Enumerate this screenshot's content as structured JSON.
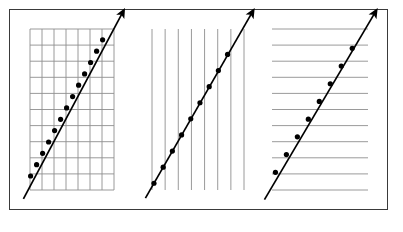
{
  "figure": {
    "background_color": "#ffffff",
    "frame": {
      "name": "outer-border",
      "x": 9,
      "y": 9,
      "width": 379,
      "height": 201,
      "stroke_color": "#3a3a3a",
      "stroke_width": 1.2
    },
    "grid_color": "#8f8f8f",
    "grid_stroke_width": 0.9,
    "data_color": "#000000",
    "data_stroke_width": 1.7,
    "marker_radius": 2.6,
    "panel_count": 3
  },
  "chart_data": [
    {
      "type": "scatter",
      "name": "panel-full-grid",
      "title": "",
      "xlabel": "",
      "ylabel": "",
      "grid": "both",
      "grid_columns": 7,
      "grid_rows": 10,
      "legend": "none",
      "xlim": [
        0,
        7
      ],
      "ylim": [
        0,
        10
      ],
      "plot_box": {
        "x": 30,
        "y": 29,
        "width": 84,
        "height": 161
      },
      "gridline_x_values": [
        0,
        1,
        2,
        3,
        4,
        5,
        6,
        7
      ],
      "gridline_y_values": [
        0,
        1,
        2,
        3,
        4,
        5,
        6,
        7,
        8,
        9,
        10
      ],
      "line": {
        "start": {
          "x": -0.55,
          "y": -0.55
        },
        "end": {
          "x": 7.7,
          "y": 11.0
        },
        "arrow_at_end": true
      },
      "x": [
        0.05,
        0.55,
        1.05,
        1.55,
        2.05,
        2.55,
        3.05,
        3.55,
        4.05,
        4.55,
        5.05,
        5.55,
        6.05
      ],
      "values": [
        0.87,
        1.57,
        2.28,
        2.98,
        3.69,
        4.39,
        5.1,
        5.8,
        6.51,
        7.21,
        7.92,
        8.62,
        9.33
      ],
      "point_count": 13
    },
    {
      "type": "scatter",
      "name": "panel-vertical-grid",
      "title": "",
      "xlabel": "",
      "ylabel": "",
      "grid": "vertical-only",
      "grid_columns": 8,
      "grid_rows": 0,
      "legend": "none",
      "xlim": [
        0,
        7
      ],
      "ylim": [
        0,
        10
      ],
      "plot_box": {
        "x": 152,
        "y": 29,
        "width": 92,
        "height": 161
      },
      "gridline_x_values": [
        0,
        1,
        2,
        3,
        4,
        5,
        6,
        7
      ],
      "gridline_y_values": [],
      "line": {
        "start": {
          "x": -0.5,
          "y": -0.5
        },
        "end": {
          "x": 7.6,
          "y": 11.0
        },
        "arrow_at_end": true
      },
      "x": [
        0.15,
        0.85,
        1.55,
        2.25,
        2.95,
        3.65,
        4.35,
        5.05,
        5.75
      ],
      "values": [
        0.42,
        1.42,
        2.42,
        3.42,
        4.42,
        5.42,
        6.42,
        7.42,
        8.42
      ],
      "point_count": 9
    },
    {
      "type": "scatter",
      "name": "panel-horizontal-grid",
      "title": "",
      "xlabel": "",
      "ylabel": "",
      "grid": "horizontal-only",
      "grid_columns": 0,
      "grid_rows": 10,
      "legend": "none",
      "xlim": [
        0,
        7
      ],
      "ylim": [
        0,
        10
      ],
      "plot_box": {
        "x": 272,
        "y": 29,
        "width": 96,
        "height": 161
      },
      "gridline_x_values": [],
      "gridline_y_values": [
        0,
        1,
        2,
        3,
        4,
        5,
        6,
        7,
        8,
        9,
        10
      ],
      "line": {
        "start": {
          "x": -0.55,
          "y": -0.6
        },
        "end": {
          "x": 7.5,
          "y": 11.0
        },
        "arrow_at_end": true
      },
      "x": [
        0.25,
        1.05,
        1.85,
        2.65,
        3.45,
        4.25,
        5.05,
        5.85
      ],
      "values": [
        1.1,
        2.2,
        3.3,
        4.4,
        5.5,
        6.6,
        7.7,
        8.8
      ],
      "point_count": 8
    }
  ]
}
